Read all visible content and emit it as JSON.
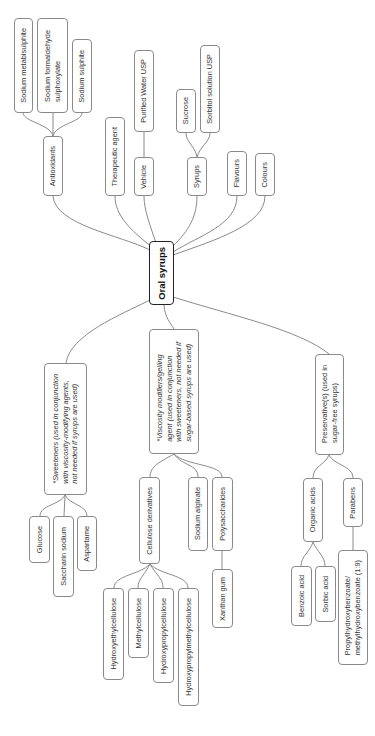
{
  "diagram": {
    "type": "mind-map",
    "orientation": "rotated-90-ccw",
    "colors": {
      "line": "#8a8a8a",
      "root_border": "#222222",
      "text": "#333333"
    },
    "root": {
      "id": "root",
      "label": "Oral syrups"
    },
    "nodes": [
      {
        "id": "antioxidants",
        "label": "Antioxidants",
        "parent": "root"
      },
      {
        "id": "sodium-metabisulphite",
        "label": "Sodium metabisulphite",
        "parent": "antioxidants"
      },
      {
        "id": "sodium-formaldehyde-sulphoxylate",
        "label": "Sodium formaldehyde\nsulphoxylate",
        "parent": "antioxidants"
      },
      {
        "id": "sodium-sulphite",
        "label": "Sodium sulphite",
        "parent": "antioxidants"
      },
      {
        "id": "therapeutic-agent",
        "label": "Therapeutic agent",
        "parent": "root"
      },
      {
        "id": "vehicle",
        "label": "Vehicle",
        "parent": "root"
      },
      {
        "id": "purified-water",
        "label": "Purified Water USP",
        "parent": "vehicle"
      },
      {
        "id": "syrups",
        "label": "Syrups",
        "parent": "root"
      },
      {
        "id": "sucrose",
        "label": "Sucrose",
        "parent": "syrups"
      },
      {
        "id": "sorbitol",
        "label": "Sorbitol solution USP",
        "parent": "syrups"
      },
      {
        "id": "flavours",
        "label": "Flavours",
        "parent": "root"
      },
      {
        "id": "colours",
        "label": "Colours",
        "parent": "root"
      },
      {
        "id": "sweeteners",
        "label": "*Sweeteners (used in conjunction\nwith viscosity-modifying agents,\nnot needed if syrups are used)",
        "parent": "root"
      },
      {
        "id": "glucose",
        "label": "Glucose",
        "parent": "sweeteners"
      },
      {
        "id": "saccharin",
        "label": "Saccharin sodium",
        "parent": "sweeteners"
      },
      {
        "id": "aspartame",
        "label": "Aspartame",
        "parent": "sweeteners"
      },
      {
        "id": "viscosity",
        "label": "*Viscosity modifiers/gelling\nagent (used in conjunction\nwith sweeteners, not needed if\nsugar-based syrups are used)",
        "parent": "root"
      },
      {
        "id": "cellulose",
        "label": "Cellulose derivatives",
        "parent": "viscosity"
      },
      {
        "id": "sodium-alginate",
        "label": "Sodium alginate",
        "parent": "viscosity"
      },
      {
        "id": "polysaccharides",
        "label": "Polysaccharides",
        "parent": "viscosity"
      },
      {
        "id": "xanthan",
        "label": "Xanthan gum",
        "parent": "polysaccharides"
      },
      {
        "id": "hec",
        "label": "Hydroxyethylcellulose",
        "parent": "cellulose"
      },
      {
        "id": "mc",
        "label": "Methylcellulose",
        "parent": "cellulose"
      },
      {
        "id": "hpc",
        "label": "Hydroxypropylcellulose",
        "parent": "cellulose"
      },
      {
        "id": "hpmc",
        "label": "Hydroxypropylmethylcellulose",
        "parent": "cellulose"
      },
      {
        "id": "preservatives",
        "label": "Preservative(s) (used in\nsugar-free syrups)",
        "parent": "root"
      },
      {
        "id": "organic-acids",
        "label": "Organic acids",
        "parent": "preservatives"
      },
      {
        "id": "parabens",
        "label": "Parabens",
        "parent": "preservatives"
      },
      {
        "id": "benzoic",
        "label": "Benzoic acid",
        "parent": "organic-acids"
      },
      {
        "id": "sorbic",
        "label": "Sorbic acid",
        "parent": "organic-acids"
      },
      {
        "id": "propyl-methyl",
        "label": "Propylhydroxybenzoate/\nmethylhydroxybenzoate (1:9)",
        "parent": "parabens"
      }
    ]
  }
}
